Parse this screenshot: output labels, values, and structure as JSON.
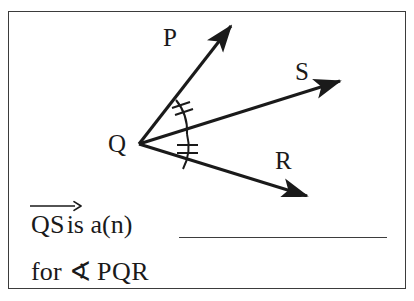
{
  "figure": {
    "vertex_label": "Q",
    "ray_labels": {
      "p": "P",
      "s": "S",
      "r": "R"
    },
    "arc_marks": {
      "upper_angle": "∠PQS",
      "lower_angle": "∠SQR",
      "tick_count": 2,
      "meaning": "congruent angles"
    },
    "stroke_color": "#1a1a1a",
    "background_color": "#ffffff",
    "points": {
      "Q": [
        138,
        143
      ],
      "P_tip": [
        232,
        22
      ],
      "S_tip": [
        343,
        79
      ],
      "R_tip": [
        310,
        196
      ]
    }
  },
  "question": {
    "ray_term": "QS",
    "ray_arrow_icon": "ray-arrow-overline",
    "line1_rest": "is a(n)",
    "answer_blank": "",
    "line2_for": "for",
    "angle_symbol": "∢",
    "angle_name": "PQR"
  },
  "colors": {
    "ink": "#1a1a1a",
    "frame": "#3b3b3b",
    "blank_rule": "#3d3d3d",
    "paper": "#ffffff"
  }
}
